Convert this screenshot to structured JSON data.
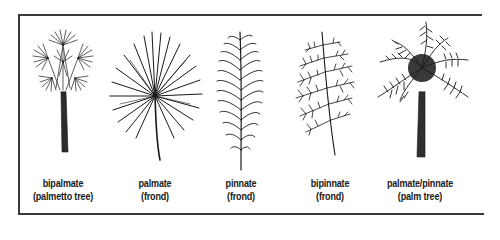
{
  "figure": {
    "line_color": "#1a1a1a",
    "background": "#ffffff"
  },
  "plants": [
    {
      "name": "bipalmate",
      "note": "(palmetto tree)",
      "cx": 63
    },
    {
      "name": "palmate",
      "note": "(frond)",
      "cx": 155
    },
    {
      "name": "pinnate",
      "note": "(frond)",
      "cx": 241
    },
    {
      "name": "bipinnate",
      "note": "(frond)",
      "cx": 330
    },
    {
      "name": "palmate/pinnate",
      "note": "(palm tree)",
      "cx": 420
    }
  ]
}
